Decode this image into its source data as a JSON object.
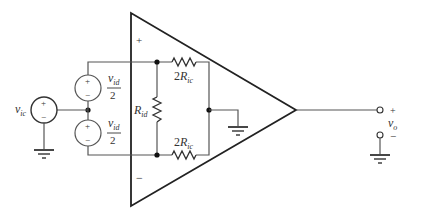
{
  "diagram": {
    "type": "circuit-schematic",
    "opamp": {
      "plus_sign": "+",
      "minus_sign": "−"
    },
    "sources": {
      "vid_top": {
        "symbol": "v",
        "sub": "id",
        "denominator": "2",
        "plus": "+",
        "minus": "−"
      },
      "vid_bottom": {
        "symbol": "v",
        "sub": "id",
        "denominator": "2",
        "plus": "+",
        "minus": "−"
      },
      "vic": {
        "symbol": "v",
        "sub": "ic",
        "plus": "+",
        "minus": "−"
      }
    },
    "resistors": {
      "top": {
        "prefix": "2",
        "symbol": "R",
        "sub": "ic"
      },
      "bottom": {
        "prefix": "2",
        "symbol": "R",
        "sub": "ic"
      },
      "rid": {
        "symbol": "R",
        "sub": "id"
      }
    },
    "output": {
      "symbol": "v",
      "sub": "o",
      "plus": "+",
      "minus": "−"
    },
    "colors": {
      "line": "#333333",
      "background": "#ffffff"
    }
  }
}
